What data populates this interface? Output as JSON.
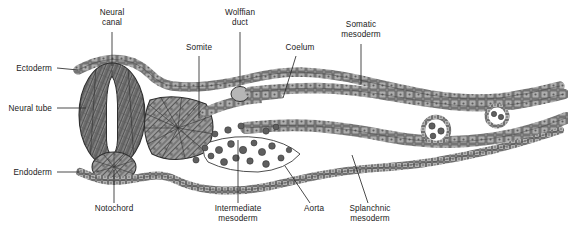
{
  "figure": {
    "background_color": "#ffffff",
    "tissue_fill": "#9a9a9a",
    "tissue_outline": "#3a3a3a",
    "leader_color": "#2b2b2b",
    "label_color": "#1a1a1a",
    "width": 568,
    "height": 232
  },
  "labels": [
    {
      "id": "ectoderm",
      "text": "Ectoderm",
      "text2": "",
      "x": 52,
      "y": 64,
      "align": "right",
      "leader": {
        "x1": 57,
        "y1": 68,
        "x2": 78,
        "y2": 70
      }
    },
    {
      "id": "neural-tube",
      "text": "Neural tube",
      "text2": "",
      "x": 52,
      "y": 104,
      "align": "right",
      "leader": {
        "x1": 57,
        "y1": 108,
        "x2": 86,
        "y2": 108
      }
    },
    {
      "id": "endoderm",
      "text": "Endoderm",
      "text2": "",
      "x": 52,
      "y": 168,
      "align": "right",
      "leader": {
        "x1": 57,
        "y1": 172,
        "x2": 80,
        "y2": 172
      }
    },
    {
      "id": "neural-canal",
      "text": "Neural",
      "text2": "canal",
      "x": 112,
      "y": 8,
      "align": "center",
      "leader": {
        "x1": 112,
        "y1": 32,
        "x2": 112,
        "y2": 66
      }
    },
    {
      "id": "somite",
      "text": "Somite",
      "text2": "",
      "x": 199,
      "y": 43,
      "align": "center",
      "leader": {
        "x1": 199,
        "y1": 56,
        "x2": 199,
        "y2": 118
      }
    },
    {
      "id": "wolffian-duct",
      "text": "Wolffian",
      "text2": "duct",
      "x": 240,
      "y": 8,
      "align": "center",
      "leader": {
        "x1": 240,
        "y1": 32,
        "x2": 240,
        "y2": 87
      }
    },
    {
      "id": "coelum",
      "text": "Coelum",
      "text2": "",
      "x": 300,
      "y": 43,
      "align": "center",
      "leader": {
        "x1": 296,
        "y1": 56,
        "x2": 283,
        "y2": 98
      }
    },
    {
      "id": "somatic-mesoderm",
      "text": "Somatic",
      "text2": "mesoderm",
      "x": 361,
      "y": 20,
      "align": "center",
      "leader": {
        "x1": 361,
        "y1": 44,
        "x2": 361,
        "y2": 84
      }
    },
    {
      "id": "notochord",
      "text": "Notochord",
      "text2": "",
      "x": 114,
      "y": 204,
      "align": "center",
      "leader": {
        "x1": 114,
        "y1": 203,
        "x2": 114,
        "y2": 170
      }
    },
    {
      "id": "intermediate-mesoderm",
      "text": "Intermediate",
      "text2": "mesoderm",
      "x": 238,
      "y": 204,
      "align": "center",
      "leader": {
        "x1": 238,
        "y1": 203,
        "x2": 238,
        "y2": 140
      }
    },
    {
      "id": "aorta",
      "text": "Aorta",
      "text2": "",
      "x": 314,
      "y": 204,
      "align": "center",
      "leader": {
        "x1": 310,
        "y1": 203,
        "x2": 285,
        "y2": 166
      }
    },
    {
      "id": "splanchnic-mesoderm",
      "text": "Splanchnic",
      "text2": "mesoderm",
      "x": 370,
      "y": 204,
      "align": "center",
      "leader": {
        "x1": 368,
        "y1": 203,
        "x2": 352,
        "y2": 155
      }
    }
  ]
}
